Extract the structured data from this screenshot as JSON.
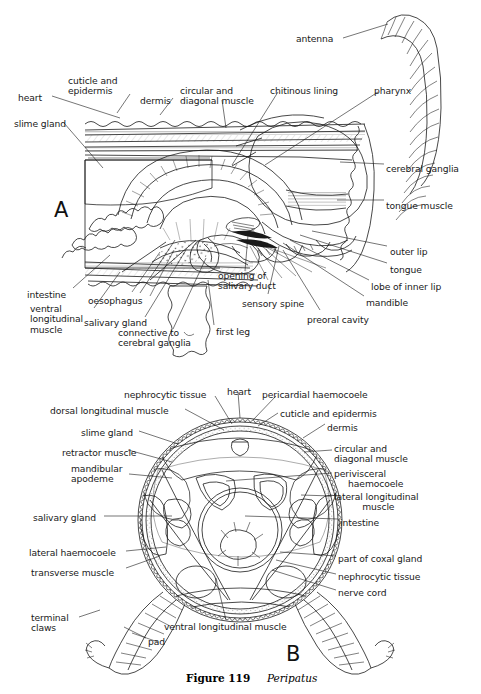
{
  "figure": {
    "number": "Figure 119",
    "genus": "Peripatus",
    "panel_a_letter": "A",
    "panel_b_letter": "B"
  },
  "colors": {
    "ink": "#1a1a1a",
    "paper": "#ffffff",
    "stipple": "#555555"
  },
  "panel_a": {
    "title": "Sagittal section through the head of Peripatus",
    "labels": [
      {
        "id": "antenna",
        "text": "antenna",
        "x": 296,
        "y": 34,
        "align": "left",
        "lead": [
          [
            343,
            38
          ],
          [
            388,
            24
          ]
        ]
      },
      {
        "id": "heart",
        "text": "heart",
        "x": 18,
        "y": 93,
        "align": "left",
        "lead": [
          [
            52,
            96
          ],
          [
            120,
            118
          ]
        ]
      },
      {
        "id": "cuticle-epidermis",
        "text": "cuticle and\nepidermis",
        "x": 68,
        "y": 76,
        "align": "left",
        "lead": [
          [
            130,
            94
          ],
          [
            117,
            113
          ]
        ]
      },
      {
        "id": "dermis",
        "text": "dermis",
        "x": 140,
        "y": 96,
        "align": "left",
        "lead": [
          [
            173,
            98
          ],
          [
            160,
            115
          ]
        ]
      },
      {
        "id": "circular-diagonal",
        "text": "circular and\ndiagonal muscle",
        "x": 180,
        "y": 86,
        "align": "left",
        "lead": [
          [
            222,
            100
          ],
          [
            226,
            128
          ]
        ]
      },
      {
        "id": "chitinous-lining",
        "text": "chitinous lining",
        "x": 270,
        "y": 86,
        "align": "left",
        "lead": [
          [
            278,
            92
          ],
          [
            232,
            165
          ]
        ]
      },
      {
        "id": "pharynx",
        "text": "pharynx",
        "x": 374,
        "y": 86,
        "align": "left",
        "lead": [
          [
            378,
            92
          ],
          [
            265,
            165
          ]
        ]
      },
      {
        "id": "slime-gland",
        "text": "slime gland",
        "x": 14,
        "y": 119,
        "align": "left",
        "lead": [
          [
            64,
            123
          ],
          [
            103,
            168
          ]
        ]
      },
      {
        "id": "cerebral-ganglia",
        "text": "cerebral ganglia",
        "x": 386,
        "y": 164,
        "align": "left",
        "lead": [
          [
            384,
            164
          ],
          [
            340,
            162
          ]
        ]
      },
      {
        "id": "tongue-muscle",
        "text": "tongue muscle",
        "x": 386,
        "y": 201,
        "align": "left",
        "lead": [
          [
            384,
            200
          ],
          [
            337,
            200
          ]
        ]
      },
      {
        "id": "outer-lip",
        "text": "outer lip",
        "x": 390,
        "y": 247,
        "align": "left",
        "lead": [
          [
            387,
            246
          ],
          [
            312,
            231
          ]
        ]
      },
      {
        "id": "tongue",
        "text": "tongue",
        "x": 390,
        "y": 265,
        "align": "left",
        "lead": [
          [
            387,
            263
          ],
          [
            300,
            235
          ]
        ]
      },
      {
        "id": "lobe-of-inner-lip",
        "text": "lobe of inner lip",
        "x": 371,
        "y": 282,
        "align": "left",
        "lead": [
          [
            369,
            280
          ],
          [
            290,
            240
          ]
        ]
      },
      {
        "id": "mandible",
        "text": "mandible",
        "x": 366,
        "y": 298,
        "align": "left",
        "lead": [
          [
            364,
            296
          ],
          [
            283,
            243
          ]
        ]
      },
      {
        "id": "preoral-cavity",
        "text": "preoral cavity",
        "x": 307,
        "y": 315,
        "align": "left",
        "lead": [
          [
            320,
            310
          ],
          [
            283,
            250
          ]
        ]
      },
      {
        "id": "sensory-spine",
        "text": "sensory spine",
        "x": 242,
        "y": 299,
        "align": "left",
        "lead": [
          [
            268,
            294
          ],
          [
            279,
            246
          ]
        ]
      },
      {
        "id": "opening-salivary",
        "text": "opening of\nsalivary duct",
        "x": 218,
        "y": 271,
        "align": "left",
        "lead": [
          [
            245,
            271
          ],
          [
            248,
            235
          ]
        ]
      },
      {
        "id": "first-leg",
        "text": "first leg",
        "x": 216,
        "y": 327,
        "align": "left",
        "lead": [
          [
            214,
            325
          ],
          [
            208,
            280
          ]
        ]
      },
      {
        "id": "connective-cereb",
        "text": "connective to\ncerebral ganglia",
        "x": 118,
        "y": 328,
        "align": "left",
        "lead": [
          [
            173,
            329
          ],
          [
            206,
            258
          ]
        ]
      },
      {
        "id": "salivary-gland",
        "text": "salivary gland",
        "x": 84,
        "y": 318,
        "align": "left",
        "lead": [
          [
            145,
            317
          ],
          [
            186,
            250
          ]
        ]
      },
      {
        "id": "oesophagus",
        "text": "oesophagus",
        "x": 88,
        "y": 296,
        "align": "left",
        "lead": [
          [
            140,
            293
          ],
          [
            175,
            240
          ]
        ]
      },
      {
        "id": "ventral-long-muscle",
        "text": "ventral\nlongitudinal\nmuscle",
        "x": 30,
        "y": 304,
        "align": "left",
        "lead": [
          [
            94,
            308
          ],
          [
            120,
            272
          ]
        ]
      },
      {
        "id": "intestine",
        "text": "intestine",
        "x": 27,
        "y": 290,
        "align": "left",
        "lead": [
          [
            73,
            288
          ],
          [
            110,
            255
          ]
        ]
      }
    ]
  },
  "panel_b": {
    "title": "Transverse section through the body of Peripatus",
    "labels": [
      {
        "id": "nephrocytic-tissue-top",
        "text": "nephrocytic tissue",
        "x": 124,
        "y": 390,
        "align": "left",
        "lead": [
          [
            215,
            396
          ],
          [
            232,
            424
          ]
        ]
      },
      {
        "id": "heart",
        "text": "heart",
        "x": 227,
        "y": 387,
        "align": "left",
        "lead": [
          [
            238,
            392
          ],
          [
            240,
            418
          ]
        ]
      },
      {
        "id": "pericardial-haemocoele",
        "text": "pericardial haemocoele",
        "x": 262,
        "y": 390,
        "align": "left",
        "lead": [
          [
            276,
            396
          ],
          [
            253,
            420
          ]
        ]
      },
      {
        "id": "dorsal-long-muscle",
        "text": "dorsal longitudinal muscle",
        "x": 50,
        "y": 406,
        "align": "left",
        "lead": [
          [
            185,
            409
          ],
          [
            224,
            430
          ]
        ]
      },
      {
        "id": "cuticle-epidermis",
        "text": "cuticle and epidermis",
        "x": 280,
        "y": 409,
        "align": "left",
        "lead": [
          [
            278,
            413
          ],
          [
            258,
            426
          ]
        ]
      },
      {
        "id": "slime-gland",
        "text": "slime gland",
        "x": 81,
        "y": 428,
        "align": "left",
        "lead": [
          [
            139,
            431
          ],
          [
            178,
            444
          ]
        ]
      },
      {
        "id": "dermis",
        "text": "dermis",
        "x": 327,
        "y": 423,
        "align": "left",
        "lead": [
          [
            325,
            424
          ],
          [
            303,
            438
          ]
        ]
      },
      {
        "id": "retractor-muscle",
        "text": "retractor muscle",
        "x": 62,
        "y": 448,
        "align": "left",
        "lead": [
          [
            128,
            450
          ],
          [
            172,
            462
          ]
        ]
      },
      {
        "id": "circular-diagonal",
        "text": "circular and\ndiagonal muscle",
        "x": 334,
        "y": 444,
        "align": "left",
        "lead": [
          [
            332,
            450
          ],
          [
            304,
            452
          ]
        ]
      },
      {
        "id": "mandibular-apodeme",
        "text": "mandibular\napodeme",
        "x": 71,
        "y": 464,
        "align": "left",
        "lead": [
          [
            129,
            474
          ],
          [
            172,
            478
          ]
        ]
      },
      {
        "id": "perivisceral-haemocoele",
        "text": "perivisceral\n     haemocoele",
        "x": 334,
        "y": 469,
        "align": "left",
        "lead": [
          [
            332,
            473
          ],
          [
            226,
            481
          ]
        ]
      },
      {
        "id": "lateral-long-muscle",
        "text": "lateral longitudinal\n          muscle",
        "x": 334,
        "y": 492,
        "align": "left",
        "lead": [
          [
            332,
            496
          ],
          [
            301,
            495
          ]
        ]
      },
      {
        "id": "salivary-gland",
        "text": "salivary gland",
        "x": 33,
        "y": 513,
        "align": "left",
        "lead": [
          [
            104,
            516
          ],
          [
            172,
            516
          ]
        ]
      },
      {
        "id": "intestine",
        "text": "intestine",
        "x": 340,
        "y": 518,
        "align": "left",
        "lead": [
          [
            338,
            519
          ],
          [
            245,
            516
          ]
        ]
      },
      {
        "id": "lateral-haemocoele",
        "text": "lateral haemocoele",
        "x": 29,
        "y": 548,
        "align": "left",
        "lead": [
          [
            126,
            551
          ],
          [
            166,
            547
          ]
        ]
      },
      {
        "id": "transverse-muscle",
        "text": "transverse muscle",
        "x": 31,
        "y": 568,
        "align": "left",
        "lead": [
          [
            126,
            568
          ],
          [
            160,
            556
          ]
        ]
      },
      {
        "id": "part-of-coxal-gland",
        "text": "part of coxal gland",
        "x": 338,
        "y": 554,
        "align": "left",
        "lead": [
          [
            336,
            556
          ],
          [
            280,
            552
          ]
        ]
      },
      {
        "id": "nephrocytic-tissue-low",
        "text": "nephrocytic tissue",
        "x": 338,
        "y": 572,
        "align": "left",
        "lead": [
          [
            336,
            574
          ],
          [
            276,
            560
          ]
        ]
      },
      {
        "id": "nerve-cord",
        "text": "nerve cord",
        "x": 338,
        "y": 588,
        "align": "left",
        "lead": [
          [
            336,
            590
          ],
          [
            272,
            570
          ]
        ]
      },
      {
        "id": "ventral-long-muscle",
        "text": "ventral longitudinal muscle",
        "x": 164,
        "y": 622,
        "align": "left",
        "lead": [
          [
            226,
            620
          ],
          [
            216,
            578
          ]
        ]
      },
      {
        "id": "terminal-claws",
        "text": "terminal\nclaws",
        "x": 31,
        "y": 613,
        "align": "left",
        "lead": [
          [
            79,
            617
          ],
          [
            100,
            610
          ]
        ]
      },
      {
        "id": "pad",
        "text": "pad",
        "x": 148,
        "y": 637,
        "align": "left",
        "lead": [
          [
            146,
            638
          ],
          [
            124,
            627
          ]
        ]
      }
    ]
  }
}
